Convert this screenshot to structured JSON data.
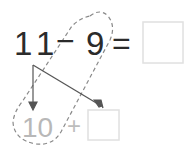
{
  "equation": {
    "minuend": "11",
    "operator": "−",
    "subtrahend": "9",
    "equals": "=",
    "answer_box": ""
  },
  "decomposition": {
    "tens": "10",
    "plus": "+",
    "ones_box": ""
  },
  "colors": {
    "ink": "#2b2b2b",
    "faded_ink": "#b8b8b8",
    "dashed": "#888888",
    "box_border": "#e2e2e2"
  }
}
